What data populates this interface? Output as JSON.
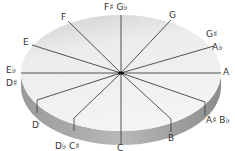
{
  "diagram": {
    "title": "",
    "type": "pitch-class circle (3D disc)",
    "colors": {
      "top_surface_light": "#f2f2f2",
      "top_surface_dark": "#d4d4d4",
      "side_light": "#c8c8c8",
      "side_dark": "#8c8c8c",
      "line": "#2a2a2a",
      "label": "#333333"
    },
    "labels": [
      {
        "id": "fs-gb",
        "text": "F♯  G♭"
      },
      {
        "id": "g",
        "text": "G"
      },
      {
        "id": "gs",
        "text": "G♯"
      },
      {
        "id": "ab",
        "text": "A♭"
      },
      {
        "id": "a",
        "text": "A"
      },
      {
        "id": "as-bb",
        "text": "A♯  B♭"
      },
      {
        "id": "b",
        "text": "B"
      },
      {
        "id": "c",
        "text": "C"
      },
      {
        "id": "db-cs",
        "text": "D♭  C♯"
      },
      {
        "id": "d",
        "text": "D"
      },
      {
        "id": "eb",
        "text": "E♭"
      },
      {
        "id": "ds",
        "text": "D♯"
      },
      {
        "id": "e",
        "text": "E"
      },
      {
        "id": "f",
        "text": "F"
      }
    ]
  }
}
